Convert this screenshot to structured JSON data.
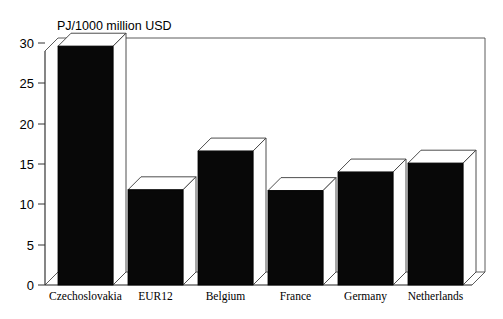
{
  "chart_data": {
    "type": "bar",
    "title": "",
    "ylabel": "PJ/1000 million USD",
    "xlabel": "",
    "categories": [
      "Czechoslovakia",
      "EUR12",
      "Belgium",
      "France",
      "Germany",
      "Netherlands"
    ],
    "values": [
      29.6,
      11.8,
      16.6,
      11.7,
      14.0,
      15.1
    ],
    "ylim": [
      0,
      30
    ],
    "yticks": [
      0,
      5,
      10,
      15,
      20,
      25,
      30
    ],
    "ytick_labels": [
      "0",
      "5",
      "10",
      "15",
      "20",
      "25",
      "30"
    ],
    "grid": false,
    "legend": "none",
    "style": "3d-bars",
    "colors": {
      "bar_face": "#080808",
      "bar_top": "#ffffff",
      "bar_side": "#ffffff",
      "frame": "#4a4a4a",
      "background": "#ffffff",
      "text": "#000000"
    }
  },
  "axis": {
    "unit_label": "PJ/1000 million USD"
  }
}
